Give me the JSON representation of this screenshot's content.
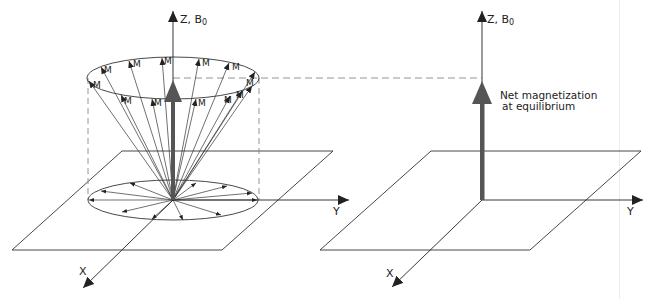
{
  "figure": {
    "left_panel": {
      "title": "Precessing spins around B0",
      "z_axis_label": "Z, B",
      "z_axis_subscript": "0",
      "y_axis_label": "Y",
      "x_axis_label": "X",
      "vector_label": "M",
      "vector_count_top": 14,
      "vector_count_base": 12
    },
    "right_panel": {
      "z_axis_label": "Z, B",
      "z_axis_subscript": "0",
      "y_axis_label": "Y",
      "x_axis_label": "X",
      "annotation_line1": "Net magnetization",
      "annotation_line2": "at equilibrium"
    },
    "colors": {
      "line": "#333333",
      "net_vector": "#555555",
      "dashed": "#777777"
    }
  }
}
